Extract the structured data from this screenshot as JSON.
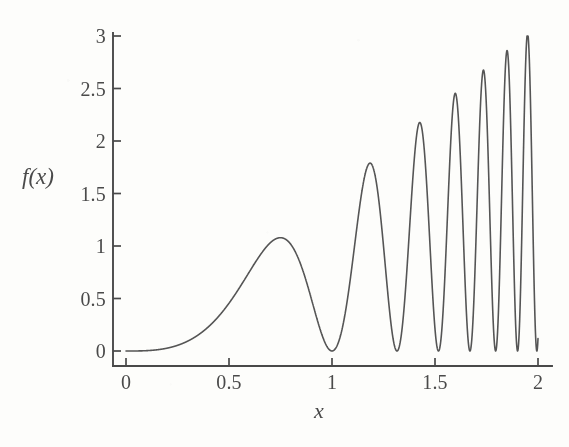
{
  "figure": {
    "kind": "scanned-textbook-plot",
    "background_color": "#fdfdfb",
    "ink_color": "#555555",
    "axis_color": "#4a4a4a"
  },
  "axes": {
    "y_title": "f(x)",
    "x_title": "x"
  },
  "chart_data": {
    "type": "line",
    "title": "",
    "subtitle": "",
    "xlabel": "x",
    "ylabel": "f(x)",
    "xlim": [
      0,
      2.05
    ],
    "ylim": [
      -0.05,
      3.1
    ],
    "xticks": [
      0,
      0.5,
      1,
      1.5,
      2
    ],
    "xtick_labels": [
      "0",
      "0.5",
      "1",
      "1.5",
      "2"
    ],
    "yticks": [
      0,
      0.5,
      1,
      1.5,
      2,
      2.5,
      3
    ],
    "ytick_labels": [
      "0",
      "0.5",
      "1",
      "1.5",
      "2",
      "2.5",
      "3"
    ],
    "grid": false,
    "legend": "none",
    "series": [
      {
        "name": "f(x)",
        "color": "#555555",
        "linewidth": 1.6,
        "description": "Non-negative chirp: amplitude grows with x while oscillation frequency increases; minima touch zero, peaks rise from about 1.75 near x=0.71 to about 3.0 at x=2.",
        "model": {
          "form": "amplitude(x) * sin(phase(x))^2",
          "amplitude": "1.5 * x^1.05",
          "phase": "pi * (0.5 * x^3.6 + 0.5 * x)"
        },
        "annotated_points": [
          {
            "x": 0.0,
            "y": 0.0
          },
          {
            "x": 0.25,
            "y": 0.18
          },
          {
            "x": 0.5,
            "y": 0.75
          },
          {
            "x": 0.71,
            "y": 1.75
          },
          {
            "x": 0.93,
            "y": 0.0
          },
          {
            "x": 1.06,
            "y": 2.1
          },
          {
            "x": 1.17,
            "y": 0.0
          },
          {
            "x": 1.22,
            "y": 2.1
          },
          {
            "x": 1.3,
            "y": 0.0
          },
          {
            "x": 1.36,
            "y": 2.25
          },
          {
            "x": 1.5,
            "y": 2.45
          },
          {
            "x": 1.65,
            "y": 2.6
          },
          {
            "x": 1.8,
            "y": 2.8
          },
          {
            "x": 2.0,
            "y": 3.0
          }
        ]
      }
    ]
  }
}
